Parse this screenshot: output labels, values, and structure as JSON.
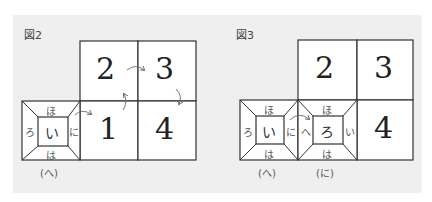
{
  "figures": [
    {
      "label": "図2",
      "cells": [
        {
          "num": "2",
          "pos": "top-left"
        },
        {
          "num": "3",
          "pos": "top-right"
        },
        {
          "num": "1",
          "pos": "bottom-left"
        },
        {
          "num": "4",
          "pos": "bottom-right"
        }
      ],
      "net_boxes": [
        {
          "center": "い",
          "top": "ほ",
          "bottom": "は",
          "left": "ろ",
          "right": "に",
          "caption": "(へ)"
        }
      ],
      "arrows": [
        "2→3",
        "3→4",
        "1→2",
        "box(へ)→1"
      ]
    },
    {
      "label": "図3",
      "cells": [
        {
          "num": "2",
          "pos": "top-left"
        },
        {
          "num": "3",
          "pos": "top-right"
        },
        {
          "num": "4",
          "pos": "bottom-right"
        }
      ],
      "net_boxes": [
        {
          "center": "い",
          "top": "ほ",
          "bottom": "は",
          "left": "ろ",
          "right": "に",
          "caption": "(へ)"
        },
        {
          "center": "ろ",
          "top": "ほ",
          "bottom": "は",
          "left": "へ",
          "right": "い",
          "caption": "(に)"
        }
      ],
      "arrows": [
        "box(へ)→box(に)"
      ]
    }
  ],
  "colors": {
    "panel_bg": "#efefef",
    "cell_bg": "#ffffff",
    "line": "#333333",
    "arrow": "#666666"
  }
}
